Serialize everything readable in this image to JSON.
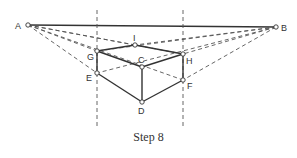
{
  "figure": {
    "caption": "Step 8",
    "points": {
      "A": {
        "label": "A",
        "x": 28,
        "y": 25
      },
      "B": {
        "label": "B",
        "x": 276,
        "y": 27
      },
      "G": {
        "label": "G",
        "x": 97,
        "y": 51
      },
      "E": {
        "label": "E",
        "x": 97,
        "y": 73
      },
      "I": {
        "label": "I",
        "x": 135,
        "y": 45
      },
      "C": {
        "label": "C",
        "x": 142,
        "y": 67
      },
      "D": {
        "label": "D",
        "x": 142,
        "y": 102
      },
      "H": {
        "label": "H",
        "x": 183,
        "y": 54
      },
      "F": {
        "label": "F",
        "x": 183,
        "y": 80
      }
    },
    "colors": {
      "line": "#333333",
      "dash": "#555555",
      "background": "#ffffff"
    }
  }
}
